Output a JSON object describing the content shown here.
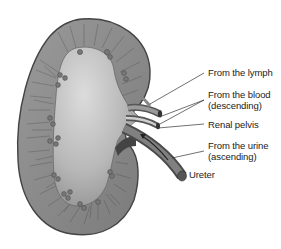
{
  "diagram": {
    "labels": [
      {
        "id": "lymph",
        "line1": "From the lymph",
        "line2": ""
      },
      {
        "id": "blood",
        "line1": "From the blood",
        "line2": "(descending)"
      },
      {
        "id": "pelvis",
        "line1": "Renal pelvis",
        "line2": ""
      },
      {
        "id": "urine",
        "line1": "From the urine",
        "line2": "(ascending)"
      },
      {
        "id": "ureter",
        "line1": "Ureter",
        "line2": ""
      }
    ],
    "colors": {
      "cortex": "#8a8a8a",
      "cortex_edge": "#4a4a4a",
      "pelvis_light": "#d4d4d4",
      "pelvis_dark": "#9a9a9a",
      "vessel": "#6a6a6a",
      "text": "#222222"
    }
  }
}
